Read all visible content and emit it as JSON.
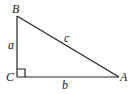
{
  "diagram": {
    "type": "right-triangle",
    "vertices": {
      "A": {
        "label": "A",
        "x": 119,
        "y": 77
      },
      "B": {
        "label": "B",
        "x": 17,
        "y": 16
      },
      "C": {
        "label": "C",
        "x": 17,
        "y": 77
      }
    },
    "sides": {
      "a": {
        "label": "a",
        "from": "B",
        "to": "C"
      },
      "b": {
        "label": "b",
        "from": "C",
        "to": "A"
      },
      "c": {
        "label": "c",
        "from": "B",
        "to": "A"
      }
    },
    "right_angle_at": "C",
    "colors": {
      "stroke": "#222222",
      "text": "#1a1a1a",
      "background": "#ffffff"
    }
  }
}
